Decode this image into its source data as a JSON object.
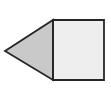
{
  "figure": {
    "background_color": "#ffffff",
    "canvas": {
      "width": 111,
      "height": 100
    },
    "stroke": {
      "color": "#262626",
      "width": 1.8,
      "linejoin": "miter"
    },
    "shapes": [
      {
        "name": "triangle",
        "kind": "polygon",
        "label": "triangle",
        "fill_color": "#c9c9c9",
        "vertex_count": 3,
        "points": "5,51 53,20 53,80",
        "vertices": [
          {
            "name": "apex-left",
            "x": 5,
            "y": 51
          },
          {
            "name": "top-right",
            "x": 53,
            "y": 20
          },
          {
            "name": "bottom-right",
            "x": 53,
            "y": 80
          }
        ]
      },
      {
        "name": "square",
        "kind": "polygon",
        "label": "square",
        "fill_color": "#eeeeee",
        "vertex_count": 4,
        "points": "53,20 104,20 104,80 53,80",
        "vertices": [
          {
            "name": "top-left",
            "x": 53,
            "y": 20
          },
          {
            "name": "top-right",
            "x": 104,
            "y": 20
          },
          {
            "name": "bottom-right",
            "x": 104,
            "y": 80
          },
          {
            "name": "bottom-left",
            "x": 53,
            "y": 80
          }
        ],
        "width": 51,
        "height": 60
      }
    ],
    "shared_edge": {
      "name": "shared-vertical-edge",
      "x": 53,
      "y_start": 20,
      "y_end": 80
    }
  }
}
